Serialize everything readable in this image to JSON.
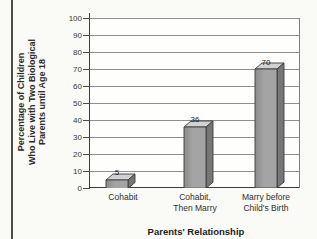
{
  "chart_data": {
    "type": "bar",
    "title": "",
    "xlabel": "Parents' Relationship",
    "ylabel": "Percentage of Children Who Live with Two Biological Parents until Age 18",
    "ylabel_display": "Percentage of Children\nWho Live with Two Biological\nParents until Age 18",
    "categories": [
      "Cohabit",
      "Cohabit,\nThen Marry",
      "Marry before\nChild's Birth"
    ],
    "values": [
      5,
      36,
      70
    ],
    "value_labels": [
      "5",
      "36",
      "70"
    ],
    "ylim": [
      0,
      100
    ],
    "y_ticks": [
      0,
      10,
      20,
      30,
      40,
      50,
      60,
      70,
      80,
      90,
      100
    ],
    "grid": true,
    "legend": "none",
    "bar_style": "3d-column",
    "colors": {
      "bar_front": "#a4a4a4",
      "bar_front_shadow": "#8b8b8b",
      "bar_top": "#d2d2d2",
      "bar_side": "#767676",
      "bar_outline": "#3c3c3c",
      "gridline": "#8f8f8f",
      "axis": "#3c3c3c",
      "page_rule": "#4b4b4b",
      "background": "#fafaf7"
    }
  }
}
